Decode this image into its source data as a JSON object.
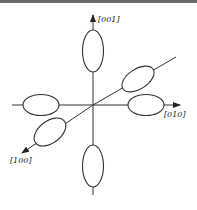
{
  "figure": {
    "type": "crystal-direction-diagram",
    "axes": [
      {
        "id": "001",
        "label": "[001]",
        "direction": "up"
      },
      {
        "id": "010",
        "label": "[010]",
        "direction": "right"
      },
      {
        "id": "100",
        "label": "[100]",
        "direction": "lower-left (oblique)"
      }
    ],
    "ellipses": [
      {
        "axis": "001",
        "position": "top",
        "orientation": "vertical"
      },
      {
        "axis": "001",
        "position": "bottom",
        "orientation": "vertical"
      },
      {
        "axis": "010",
        "position": "right",
        "orientation": "horizontal"
      },
      {
        "axis": "010",
        "position": "left",
        "orientation": "horizontal"
      },
      {
        "axis": "100",
        "position": "upper-right",
        "orientation": "oblique"
      },
      {
        "axis": "100",
        "position": "lower-left",
        "orientation": "oblique"
      }
    ],
    "colors": {
      "line": "#333333",
      "background": "#ffffff",
      "top_border": "#6a6a6a"
    }
  }
}
